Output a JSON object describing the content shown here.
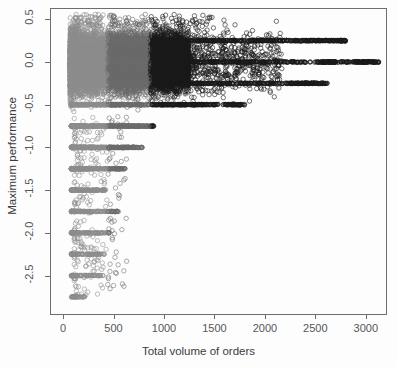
{
  "chart_data": {
    "type": "scatter",
    "title": "",
    "xlabel": "Total volume of orders",
    "ylabel": "Maximum performance",
    "xlim": [
      -120,
      3200
    ],
    "ylim": [
      -2.95,
      0.62
    ],
    "grid": false,
    "legend": null,
    "marker": "open-circle",
    "xticks": [
      0,
      500,
      1000,
      1500,
      2000,
      2500,
      3000
    ],
    "xtick_labels": [
      "0",
      "500",
      "1000",
      "1500",
      "2000",
      "2500",
      "3000"
    ],
    "yticks": [
      0.5,
      0.0,
      -0.5,
      -1.0,
      -1.5,
      -2.0,
      -2.5
    ],
    "ytick_labels": [
      "0.5",
      "0.0",
      "-0.5",
      "-1.0",
      "-1.5",
      "-2.0",
      "-2.5"
    ],
    "n_points_approx": 34000,
    "density_bands": [
      {
        "x_from": 60,
        "x_to": 440,
        "color": "#8c8c8c",
        "label": "light-grey-band"
      },
      {
        "x_from": 440,
        "x_to": 860,
        "color": "#6a6a6a",
        "label": "medium-grey-band"
      },
      {
        "x_from": 860,
        "x_to": 1250,
        "color": "#1a1a1a",
        "label": "black-band"
      }
    ],
    "value_bands": [
      {
        "y": 0.25,
        "x_max": 2800,
        "weight": 1.0
      },
      {
        "y": 0.0,
        "x_max": 3130,
        "weight": 0.95
      },
      {
        "y": -0.25,
        "x_max": 2620,
        "weight": 0.85
      },
      {
        "y": -0.5,
        "x_max": 1800,
        "weight": 0.7
      },
      {
        "y": -0.75,
        "x_max": 900,
        "weight": 0.5
      },
      {
        "y": -1.0,
        "x_max": 800,
        "weight": 0.45
      },
      {
        "y": -1.25,
        "x_max": 620,
        "weight": 0.3
      },
      {
        "y": -1.5,
        "x_max": 430,
        "weight": 0.18
      },
      {
        "y": -1.75,
        "x_max": 560,
        "weight": 0.16
      },
      {
        "y": -2.0,
        "x_max": 480,
        "weight": 0.14
      },
      {
        "y": -2.25,
        "x_max": 430,
        "weight": 0.12
      },
      {
        "y": -2.5,
        "x_max": 400,
        "weight": 0.09
      },
      {
        "y": -2.75,
        "x_max": 220,
        "weight": 0.04
      }
    ],
    "cloud": {
      "y_top": 0.55,
      "y_core_bottom": -0.55,
      "x_core_min": 60,
      "x_core_max": 900
    },
    "colors": {
      "background": "#fdfdfd",
      "box": "#6e6e6e",
      "tick_label": "#555555",
      "axis_title": "#3b3b3b",
      "point_light": "#8c8c8c",
      "point_mid": "#6a6a6a",
      "point_dark": "#1a1a1a"
    }
  },
  "axes": {
    "x_title": "Total volume of orders",
    "y_title": "Maximum performance"
  }
}
